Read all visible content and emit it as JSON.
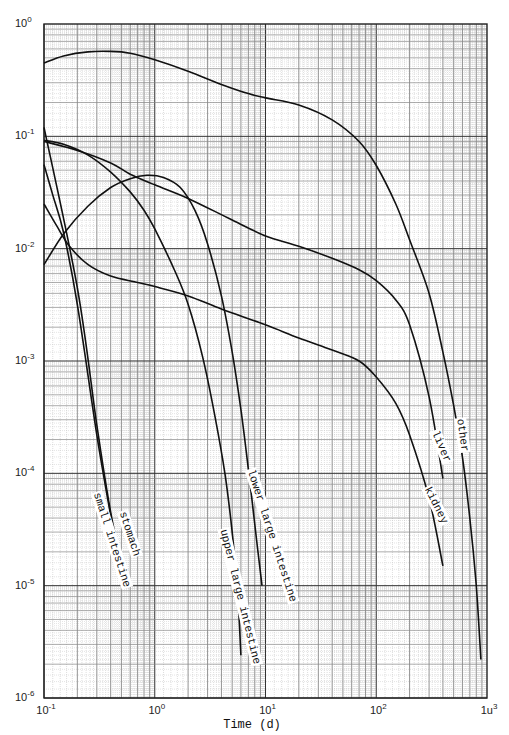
{
  "chart_data": {
    "type": "line",
    "title": "",
    "xlabel": "Time (d)",
    "ylabel": "",
    "xscale": "log",
    "yscale": "log",
    "xlim": [
      0.1,
      1000
    ],
    "ylim": [
      1e-06,
      1
    ],
    "grid": true,
    "x_tick_labels": [
      {
        "base": "10",
        "exp": "-1",
        "value": 0.1
      },
      {
        "base": "10",
        "exp": "0",
        "value": 1
      },
      {
        "base": "10",
        "exp": "1",
        "value": 10
      },
      {
        "base": "10",
        "exp": "2",
        "value": 100
      },
      {
        "base": "1u",
        "exp": "3",
        "value": 1000
      }
    ],
    "y_tick_labels": [
      {
        "base": "10",
        "exp": "0",
        "value": 1
      },
      {
        "base": "10",
        "exp": "-1",
        "value": 0.1
      },
      {
        "base": "10",
        "exp": "-2",
        "value": 0.01
      },
      {
        "base": "10",
        "exp": "-3",
        "value": 0.001
      },
      {
        "base": "10",
        "exp": "-4",
        "value": 0.0001
      },
      {
        "base": "10",
        "exp": "-5",
        "value": 1e-05
      },
      {
        "base": "10",
        "exp": "-6",
        "value": 1e-06
      }
    ],
    "series": [
      {
        "name": "other",
        "label_pos": {
          "x": 466,
          "y": 417,
          "rot": 82
        },
        "points": [
          [
            0.1,
            0.45
          ],
          [
            0.15,
            0.52
          ],
          [
            0.25,
            0.565
          ],
          [
            0.4,
            0.57
          ],
          [
            0.6,
            0.55
          ],
          [
            1,
            0.48
          ],
          [
            2,
            0.38
          ],
          [
            4,
            0.29
          ],
          [
            7,
            0.24
          ],
          [
            10,
            0.22
          ],
          [
            20,
            0.19
          ],
          [
            40,
            0.14
          ],
          [
            70,
            0.09
          ],
          [
            100,
            0.055
          ],
          [
            150,
            0.025
          ],
          [
            200,
            0.012
          ],
          [
            300,
            0.004
          ],
          [
            400,
            0.0012
          ],
          [
            500,
            0.0004
          ],
          [
            600,
            0.00014
          ],
          [
            700,
            4e-05
          ],
          [
            800,
            1e-05
          ],
          [
            880,
            2.2e-06
          ]
        ]
      },
      {
        "name": "liver",
        "label_pos": {
          "x": 440,
          "y": 428,
          "rot": 67
        },
        "points": [
          [
            0.1,
            0.09
          ],
          [
            0.2,
            0.075
          ],
          [
            0.4,
            0.058
          ],
          [
            0.6,
            0.046
          ],
          [
            1,
            0.037
          ],
          [
            2,
            0.028
          ],
          [
            5,
            0.018
          ],
          [
            10,
            0.013
          ],
          [
            20,
            0.0105
          ],
          [
            40,
            0.0082
          ],
          [
            70,
            0.0065
          ],
          [
            100,
            0.0052
          ],
          [
            150,
            0.0035
          ],
          [
            200,
            0.0021
          ],
          [
            300,
            0.00048
          ],
          [
            400,
            9e-05
          ]
        ]
      },
      {
        "name": "kidney",
        "label_pos": {
          "x": 432,
          "y": 484,
          "rot": 63
        },
        "points": [
          [
            0.1,
            0.025
          ],
          [
            0.13,
            0.016
          ],
          [
            0.17,
            0.0105
          ],
          [
            0.25,
            0.0072
          ],
          [
            0.4,
            0.0057
          ],
          [
            0.7,
            0.005
          ],
          [
            1,
            0.0046
          ],
          [
            2,
            0.0038
          ],
          [
            4,
            0.0029
          ],
          [
            10,
            0.0021
          ],
          [
            20,
            0.0016
          ],
          [
            40,
            0.00125
          ],
          [
            70,
            0.001
          ],
          [
            100,
            0.00072
          ],
          [
            150,
            0.00042
          ],
          [
            200,
            0.00022
          ],
          [
            300,
            6e-05
          ],
          [
            400,
            1.5e-05
          ]
        ]
      },
      {
        "name": "lower large intestine",
        "label_pos": {
          "x": 256,
          "y": 467,
          "rot": 72
        },
        "points": [
          [
            0.1,
            0.0072
          ],
          [
            0.15,
            0.0135
          ],
          [
            0.25,
            0.024
          ],
          [
            0.4,
            0.035
          ],
          [
            0.6,
            0.042
          ],
          [
            0.85,
            0.045
          ],
          [
            1.2,
            0.043
          ],
          [
            1.7,
            0.035
          ],
          [
            2.3,
            0.022
          ],
          [
            3,
            0.011
          ],
          [
            4,
            0.0038
          ],
          [
            5,
            0.0012
          ],
          [
            6,
            0.00037
          ],
          [
            7,
            0.00011
          ],
          [
            8,
            3.5e-05
          ],
          [
            9.3,
            1e-05
          ]
        ]
      },
      {
        "name": "upper large intestine",
        "label_pos": {
          "x": 229,
          "y": 527,
          "rot": 76
        },
        "points": [
          [
            0.1,
            0.092
          ],
          [
            0.15,
            0.085
          ],
          [
            0.25,
            0.068
          ],
          [
            0.4,
            0.048
          ],
          [
            0.6,
            0.032
          ],
          [
            0.8,
            0.022
          ],
          [
            1,
            0.015
          ],
          [
            1.5,
            0.0065
          ],
          [
            2,
            0.0032
          ],
          [
            2.7,
            0.0011
          ],
          [
            3.5,
            0.00032
          ],
          [
            4.3,
            0.0001
          ],
          [
            5,
            3e-05
          ],
          [
            5.6,
            8.5e-06
          ],
          [
            6,
            2.4e-06
          ]
        ]
      },
      {
        "name": "stomach",
        "label_pos": {
          "x": 128,
          "y": 509,
          "rot": 72
        },
        "points": [
          [
            0.1,
            0.12
          ],
          [
            0.2,
            0.0045
          ],
          [
            0.3,
            0.00027
          ],
          [
            0.4,
            4.5e-05
          ],
          [
            0.55,
            1.05e-05
          ]
        ]
      },
      {
        "name": "small intestine",
        "label_pos": {
          "x": 102,
          "y": 490,
          "rot": 72
        },
        "points": [
          [
            0.1,
            0.056
          ],
          [
            0.12,
            0.03
          ],
          [
            0.15,
            0.014
          ],
          [
            0.2,
            0.0032
          ],
          [
            0.3,
            0.00022
          ],
          [
            0.4,
            4.2e-05
          ],
          [
            0.52,
            1.05e-05
          ]
        ]
      }
    ]
  }
}
